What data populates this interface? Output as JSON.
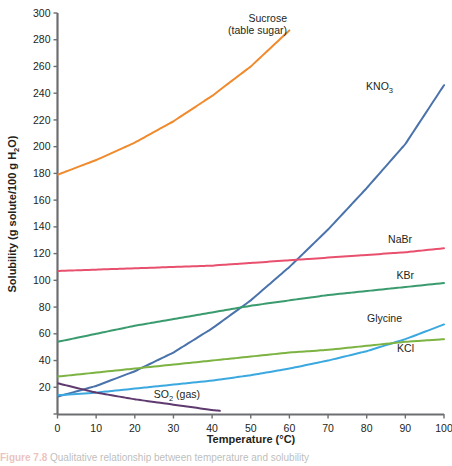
{
  "figure": {
    "caption_prefix": "Figure 7.8",
    "caption_text": "Qualitative relationship between temperature and solubility"
  },
  "chart_data": {
    "type": "line",
    "title": "",
    "xlabel": "Temperature (°C)",
    "ylabel": "Solubility (g solute/100 g H₂O)",
    "ylabel_parts": {
      "pre": "Solubility (g solute/100 g H",
      "sub": "2",
      "post": "O)"
    },
    "xlabel_parts": {
      "text": "Temperature (°C)"
    },
    "xlim": [
      0,
      100
    ],
    "ylim": [
      0,
      300
    ],
    "xticks": [
      0,
      10,
      20,
      30,
      40,
      50,
      60,
      70,
      80,
      90,
      100
    ],
    "yticks": [
      0,
      20,
      40,
      60,
      80,
      100,
      120,
      140,
      160,
      180,
      200,
      220,
      240,
      260,
      280,
      300
    ],
    "ytick_labels": [
      "",
      "20",
      "40",
      "60",
      "80",
      "100",
      "120",
      "140",
      "160",
      "180",
      "200",
      "220",
      "240",
      "260",
      "280",
      "300"
    ],
    "grid": false,
    "legend": "inline-labels",
    "x": [
      0,
      10,
      20,
      30,
      40,
      50,
      60,
      70,
      80,
      90,
      100
    ],
    "series": [
      {
        "name": "Sucrose (table sugar)",
        "label_lines": [
          "Sucrose",
          "(table sugar)"
        ],
        "color": "#f08a2c",
        "label_x": 287,
        "label_y": 22,
        "values": [
          179,
          190,
          203,
          219,
          238,
          260,
          287,
          320,
          362,
          415,
          487
        ],
        "visible_to": 60,
        "note": "Curve exits top of plot near 52 °C"
      },
      {
        "name": "KNO3",
        "label_parts": {
          "pre": "KNO",
          "sub": "3"
        },
        "color": "#4a72ab",
        "label_x": 393,
        "label_y": 90,
        "values": [
          13,
          21,
          32,
          46,
          64,
          85,
          110,
          138,
          169,
          202,
          246
        ]
      },
      {
        "name": "NaBr",
        "label_parts": {
          "pre": "NaBr",
          "sub": ""
        },
        "color": "#e8506e",
        "label_x": 412,
        "label_y": 243,
        "values": [
          107,
          108,
          109,
          110,
          111,
          113,
          115,
          117,
          119,
          121,
          124
        ]
      },
      {
        "name": "KBr",
        "label_parts": {
          "pre": "KBr",
          "sub": ""
        },
        "color": "#3a9b6e",
        "label_x": 414,
        "label_y": 279,
        "values": [
          54,
          60,
          66,
          71,
          76,
          81,
          85,
          89,
          92,
          95,
          98
        ]
      },
      {
        "name": "Glycine",
        "label_parts": {
          "pre": "Glycine",
          "sub": ""
        },
        "color": "#3ba8e0",
        "label_x": 402,
        "label_y": 322,
        "values": [
          14,
          16,
          19,
          22,
          25,
          29,
          34,
          40,
          47,
          56,
          67
        ]
      },
      {
        "name": "KCl",
        "label_parts": {
          "pre": "KCl",
          "sub": ""
        },
        "color": "#7cb342",
        "label_x": 414,
        "label_y": 352,
        "values": [
          28,
          31,
          34,
          37,
          40,
          43,
          46,
          48,
          51,
          54,
          56
        ]
      },
      {
        "name": "SO2 (gas)",
        "label_parts": {
          "pre": "SO",
          "sub": "2",
          "post": " (gas)"
        },
        "color": "#5e3a6e",
        "label_x": 200,
        "label_y": 398,
        "values": [
          23,
          16,
          11,
          7,
          3,
          0,
          0,
          0,
          0,
          0,
          0
        ],
        "visible_to": 42,
        "note": "Decreasing gas solubility, reaches ~0 near 42 °C"
      }
    ]
  }
}
